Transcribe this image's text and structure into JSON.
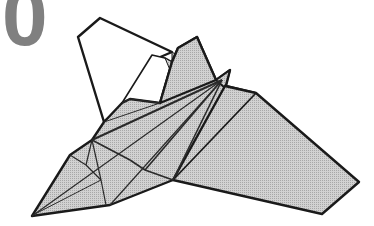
{
  "diagram": {
    "type": "origami-instruction-step",
    "step_number": "0",
    "colors": {
      "paper_fill": "#c8c8c8",
      "paper_back": "#ffffff",
      "outline": "#1a1a1a",
      "crease": "#333333",
      "step_number": "#808080"
    }
  }
}
